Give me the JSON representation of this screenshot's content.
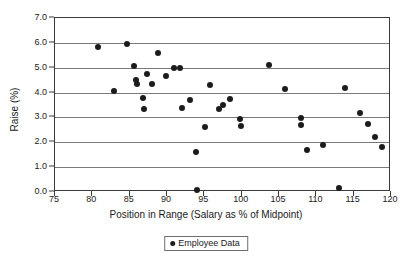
{
  "chart_data": {
    "type": "scatter",
    "title": "",
    "xlabel": "Position in Range (Salary as % of Midpoint)",
    "ylabel": "Raise (%)",
    "xlim": [
      75,
      120
    ],
    "ylim": [
      0.0,
      7.0
    ],
    "xticks": [
      "75",
      "80",
      "85",
      "90",
      "95",
      "100",
      "105",
      "110",
      "115",
      "120"
    ],
    "xtick_values": [
      75,
      80,
      85,
      90,
      95,
      100,
      105,
      110,
      115,
      120
    ],
    "yticks": [
      "0.0",
      "1.0",
      "2.0",
      "3.0",
      "4.0",
      "5.0",
      "6.0",
      "7.0"
    ],
    "ytick_values": [
      0.0,
      1.0,
      2.0,
      3.0,
      4.0,
      5.0,
      6.0,
      7.0
    ],
    "grid": "horizontal",
    "legend_position": "bottom-center",
    "marker_color": "#1c1c1c",
    "series": [
      {
        "name": "Employee Data",
        "points": [
          [
            80.7,
            5.85
          ],
          [
            82.9,
            4.05
          ],
          [
            84.7,
            5.95
          ],
          [
            85.6,
            5.05
          ],
          [
            85.9,
            4.5
          ],
          [
            86.0,
            4.35
          ],
          [
            86.8,
            3.78
          ],
          [
            86.9,
            3.35
          ],
          [
            87.3,
            4.75
          ],
          [
            88.0,
            4.35
          ],
          [
            88.8,
            5.58
          ],
          [
            89.8,
            4.67
          ],
          [
            90.9,
            4.97
          ],
          [
            91.7,
            5.0
          ],
          [
            92.0,
            3.38
          ],
          [
            93.1,
            3.7
          ],
          [
            93.9,
            1.6
          ],
          [
            94.0,
            0.08
          ],
          [
            95.1,
            2.62
          ],
          [
            95.8,
            4.3
          ],
          [
            96.9,
            3.32
          ],
          [
            97.5,
            3.5
          ],
          [
            98.4,
            3.73
          ],
          [
            99.8,
            2.95
          ],
          [
            99.9,
            2.65
          ],
          [
            103.7,
            5.12
          ],
          [
            105.8,
            4.13
          ],
          [
            107.9,
            2.98
          ],
          [
            108.0,
            2.68
          ],
          [
            108.8,
            1.68
          ],
          [
            110.9,
            1.88
          ],
          [
            113.0,
            0.17
          ],
          [
            113.9,
            4.17
          ],
          [
            115.9,
            3.18
          ],
          [
            116.9,
            2.72
          ],
          [
            117.9,
            2.2
          ],
          [
            118.8,
            1.82
          ]
        ]
      }
    ]
  },
  "legend": {
    "label": "Employee Data"
  }
}
